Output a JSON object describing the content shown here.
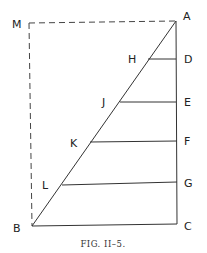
{
  "figure": {
    "caption": "FIG. II–5.",
    "points": {
      "A": "A",
      "B": "B",
      "C": "C",
      "D": "D",
      "E": "E",
      "F": "F",
      "G": "G",
      "H": "H",
      "J": "J",
      "K": "K",
      "L": "L",
      "M": "M"
    },
    "segments": [
      "AB",
      "AC",
      "BC",
      "HD",
      "JE",
      "KF",
      "LG"
    ],
    "dashed_segments": [
      "MA",
      "MB"
    ],
    "colors": {
      "line": "#333333",
      "background": "#ffffff"
    }
  }
}
